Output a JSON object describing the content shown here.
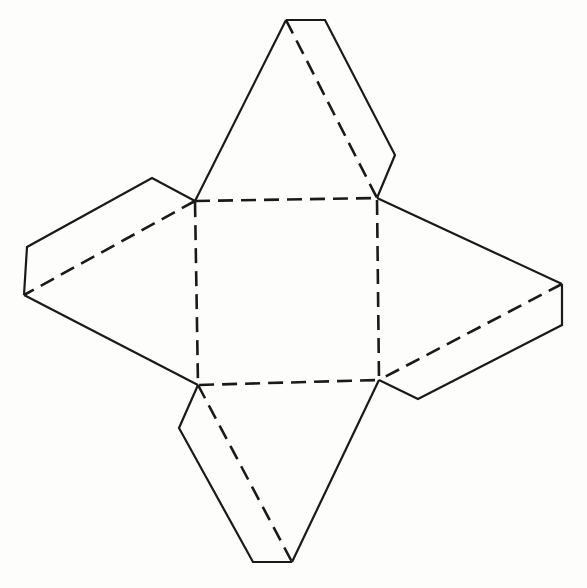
{
  "diagram": {
    "colors": {
      "line": "#1a1a1a",
      "background": "#fdfdfb"
    },
    "base_square": {
      "tl": [
        195,
        201
      ],
      "tr": [
        377,
        198
      ],
      "br": [
        379,
        380
      ],
      "bl": [
        198,
        385
      ]
    },
    "faces": {
      "top": {
        "apex": [
          286,
          20
        ],
        "tab": [
          [
            286,
            20
          ],
          [
            325,
            20
          ],
          [
            395,
            155
          ],
          [
            377,
            198
          ]
        ]
      },
      "left": {
        "apex": [
          24,
          295
        ],
        "tab": [
          [
            195,
            201
          ],
          [
            152,
            178
          ],
          [
            27,
            247
          ],
          [
            24,
            295
          ]
        ]
      },
      "right": {
        "apex": [
          562,
          284
        ],
        "tab": [
          [
            562,
            284
          ],
          [
            562,
            325
          ],
          [
            418,
            399
          ],
          [
            379,
            380
          ]
        ]
      },
      "bottom": {
        "apex": [
          292,
          562
        ],
        "tab": [
          [
            198,
            385
          ],
          [
            179,
            428
          ],
          [
            253,
            562
          ],
          [
            292,
            562
          ]
        ]
      }
    },
    "legend": {
      "solid": "cut line",
      "dashed": "fold line"
    }
  }
}
